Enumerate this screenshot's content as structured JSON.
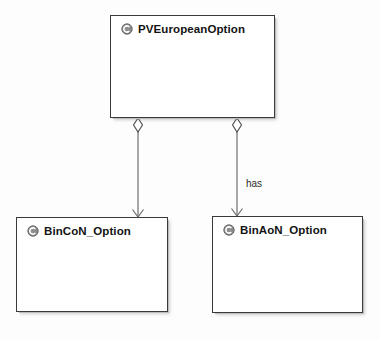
{
  "diagram": {
    "type": "uml-class-diagram",
    "background_color": "#fdfdfd",
    "line_color": "#6e6e6e",
    "border_color": "#3a3a3a",
    "classes": [
      {
        "id": "pv-european-option",
        "name": "PVEuropeanOption",
        "icon": "class-icon",
        "x": 110,
        "y": 15,
        "width": 165,
        "height": 103
      },
      {
        "id": "bin-con-option",
        "name": "BinCoN_Option",
        "icon": "class-icon",
        "x": 16,
        "y": 217,
        "width": 152,
        "height": 95
      },
      {
        "id": "bin-aon-option",
        "name": "BinAoN_Option",
        "icon": "class-icon",
        "x": 212,
        "y": 216,
        "width": 151,
        "height": 97
      }
    ],
    "relationships": [
      {
        "id": "rel-bincon",
        "kind": "aggregation",
        "from": "pv-european-option",
        "to": "bin-con-option",
        "label": "",
        "source_marker": "hollow-diamond",
        "target_marker": "open-arrow"
      },
      {
        "id": "rel-binaon",
        "kind": "aggregation",
        "from": "pv-european-option",
        "to": "bin-aon-option",
        "label": "has",
        "label_x": 246,
        "label_y": 178,
        "source_marker": "hollow-diamond",
        "target_marker": "open-arrow"
      }
    ]
  }
}
